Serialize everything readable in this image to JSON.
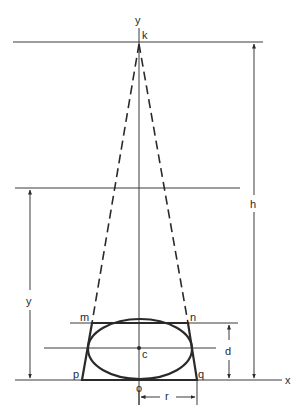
{
  "diagram": {
    "axis_labels": {
      "vertical": "y",
      "horizontal": "x"
    },
    "point_labels": {
      "apex": "k",
      "top_left": "m",
      "top_right": "n",
      "bottom_left": "p",
      "bottom_right": "q",
      "center": "c",
      "origin": "o"
    },
    "dimension_labels": {
      "height_total": "h",
      "height_y": "y",
      "depth": "d",
      "radius": "r"
    },
    "colors": {
      "ink": "#2a2a2a",
      "background": "#ffffff"
    }
  }
}
